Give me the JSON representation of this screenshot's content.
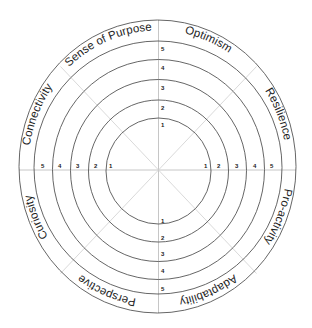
{
  "wheel": {
    "segments": [
      {
        "label": "Optimism"
      },
      {
        "label": "Resilience"
      },
      {
        "label": "Pro-activity"
      },
      {
        "label": "Adaptability"
      },
      {
        "label": "Perspective"
      },
      {
        "label": "Curiosity"
      },
      {
        "label": "Connectivity"
      },
      {
        "label": "Sense of Purpose"
      }
    ],
    "scale": [
      "1",
      "2",
      "3",
      "4",
      "5"
    ],
    "colors": {
      "rings": "#555555",
      "spokes": "#cfcfcf",
      "text": "#1e1e1e",
      "background": "#ffffff"
    }
  }
}
